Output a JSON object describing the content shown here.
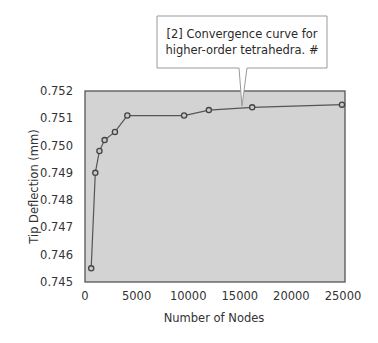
{
  "chart_data": {
    "type": "line",
    "title": "",
    "xlabel": "Number of Nodes",
    "ylabel": "Tip Deflection (mm)",
    "xlim": [
      0,
      25000
    ],
    "ylim": [
      0.745,
      0.752
    ],
    "x_ticks": [
      0,
      5000,
      10000,
      15000,
      20000,
      25000
    ],
    "x_tick_labels": [
      "0",
      "5000",
      "10000",
      "15000",
      "20000",
      "25000"
    ],
    "y_ticks": [
      0.745,
      0.746,
      0.747,
      0.748,
      0.749,
      0.75,
      0.751,
      0.752
    ],
    "y_tick_labels": [
      "0.745",
      "0.746",
      "0.747",
      "0.748",
      "0.749",
      "0.750",
      "0.751",
      "0.752"
    ],
    "grid": false,
    "legend": null,
    "series": [
      {
        "name": "Tip deflection convergence",
        "marker": "circle",
        "x": [
          600,
          1000,
          1400,
          1900,
          2900,
          4100,
          9600,
          12000,
          16200,
          24900
        ],
        "values": [
          0.7455,
          0.749,
          0.7498,
          0.7502,
          0.7505,
          0.7511,
          0.7511,
          0.7513,
          0.7514,
          0.7515
        ]
      }
    ],
    "annotations": [
      {
        "text_lines": [
          "[2] Convergence curve for",
          "higher-order tetrahedra.  #"
        ],
        "points_to_x": 15500,
        "points_to_y": 0.75143
      }
    ]
  },
  "colors": {
    "plot_background": "#d3d3d3",
    "plot_border": "#555555",
    "line": "#555555",
    "marker_edge": "#444444",
    "marker_fill": "#c8c8c8",
    "callout_border": "#9a9a9a",
    "callout_fill": "#ffffff"
  },
  "layout": {
    "plot_left": 85,
    "plot_right": 343,
    "plot_top": 91,
    "plot_bottom": 282,
    "callout": {
      "left": 157,
      "top": 16,
      "right": 327,
      "bottom": 68,
      "pointer_base_left": 239,
      "pointer_base_right": 247,
      "pointer_tip_x": 242,
      "pointer_tip_y": 106
    }
  }
}
